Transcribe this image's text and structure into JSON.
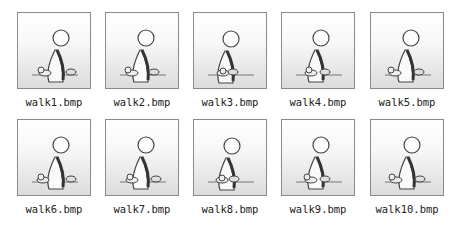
{
  "files": [
    {
      "name": "walk1.bmp",
      "icon": "walking-figure-frame-1"
    },
    {
      "name": "walk2.bmp",
      "icon": "walking-figure-frame-2"
    },
    {
      "name": "walk3.bmp",
      "icon": "walking-figure-frame-3"
    },
    {
      "name": "walk4.bmp",
      "icon": "walking-figure-frame-4"
    },
    {
      "name": "walk5.bmp",
      "icon": "walking-figure-frame-5"
    },
    {
      "name": "walk6.bmp",
      "icon": "walking-figure-frame-6"
    },
    {
      "name": "walk7.bmp",
      "icon": "walking-figure-frame-7"
    },
    {
      "name": "walk8.bmp",
      "icon": "walking-figure-frame-8"
    },
    {
      "name": "walk9.bmp",
      "icon": "walking-figure-frame-9"
    },
    {
      "name": "walk10.bmp",
      "icon": "walking-figure-frame-10"
    }
  ]
}
